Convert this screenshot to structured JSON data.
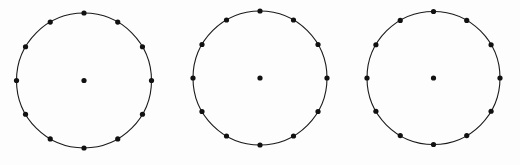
{
  "figure": {
    "canvas": {
      "width": 520,
      "height": 165,
      "background_color": "#fdfdfd"
    },
    "style": {
      "stroke_color": "#1a1a1a",
      "stroke_width": 1.1,
      "dot_color": "#111111",
      "vertex_dot_radius": 2.6,
      "center_dot_radius": 2.6
    },
    "shared": {
      "vertex_count": 12,
      "angle_step_degrees": 30,
      "start_angle_degrees": -90,
      "has_center_point": true,
      "vertex_angles_degrees": [
        -90,
        -60,
        -30,
        0,
        30,
        60,
        90,
        120,
        150,
        180,
        210,
        240
      ]
    },
    "circles": [
      {
        "id": "circle-1",
        "label": "Left circle",
        "center_x": 84,
        "center_y": 80.5,
        "radius": 67.5,
        "vertex_count": 12,
        "center_point": true
      },
      {
        "id": "circle-2",
        "label": "Middle circle",
        "center_x": 260,
        "center_y": 78,
        "radius": 67,
        "vertex_count": 12,
        "center_point": true
      },
      {
        "id": "circle-3",
        "label": "Right circle",
        "center_x": 433.5,
        "center_y": 78,
        "radius": 66.5,
        "vertex_count": 12,
        "center_point": true
      }
    ]
  }
}
